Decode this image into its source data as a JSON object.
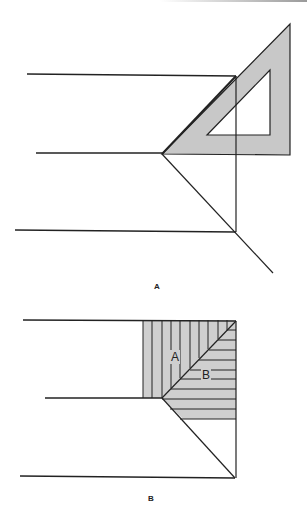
{
  "figure": {
    "panels": [
      {
        "label": "A",
        "description": "Set square (45° triangle) placed against horizontal lines to draw a 45° miter line",
        "colors": {
          "triangle_fill": "#c8c8c8",
          "line": "#222222"
        }
      },
      {
        "label": "B",
        "description": "Miter line dividing a corner region into hatched areas A (vertical hatching) and B (horizontal hatching)",
        "region_labels": [
          "A",
          "B"
        ],
        "colors": {
          "hatch_fill": "#cfcfcf",
          "line": "#222222"
        }
      }
    ]
  }
}
